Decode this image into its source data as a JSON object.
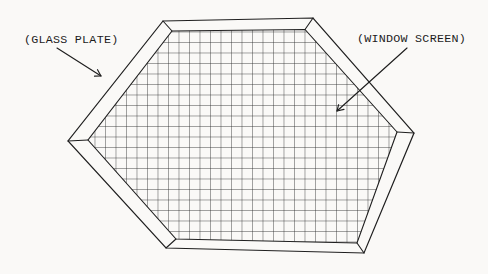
{
  "diagram": {
    "labels": {
      "glass_plate": "(GLASS PLATE)",
      "window_screen": "(WINDOW SCREEN)"
    },
    "colors": {
      "line": "#1f1f1f",
      "background": "#faf9f7",
      "text": "#1c1c1c",
      "mesh": "#2b2b2b"
    },
    "mesh": {
      "spacing_px": 10.5
    }
  }
}
